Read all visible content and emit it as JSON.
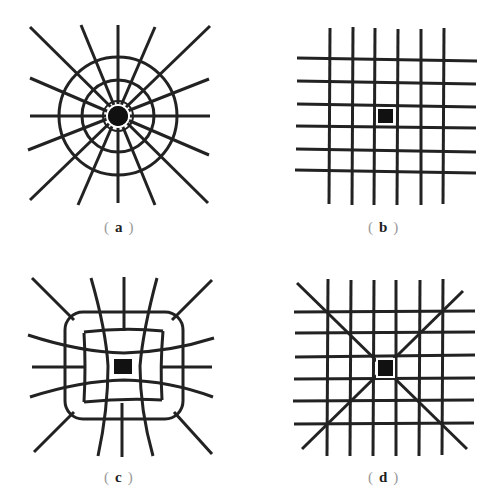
{
  "figure": {
    "stroke_color": "#222222",
    "fill_color": "#111111",
    "background": "#ffffff"
  },
  "panels": [
    {
      "id": "a",
      "label_open": "(",
      "label_letter": "a",
      "label_close": ")",
      "description": "radial pattern: concentric circles with 16 radial lines around a round dark core"
    },
    {
      "id": "b",
      "label_open": "(",
      "label_letter": "b",
      "label_close": ")",
      "description": "uniform square grid 6x6 lines with small dark square at center"
    },
    {
      "id": "c",
      "label_open": "(",
      "label_letter": "c",
      "label_close": ")",
      "description": "distorted curved grid enclosed by rounded square with dark square at center"
    },
    {
      "id": "d",
      "label_open": "(",
      "label_letter": "d",
      "label_close": ")",
      "description": "square grid 6x6 lines with two diagonals crossing at a dark square at center"
    }
  ]
}
